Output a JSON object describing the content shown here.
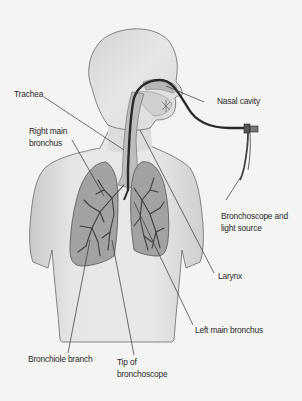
{
  "diagram": {
    "labels": {
      "trachea": "Trachea",
      "right_main_bronchus_1": "Right main",
      "right_main_bronchus_2": "bronchus",
      "nasal_cavity": "Nasal cavity",
      "bronchoscope_1": "Bronchoscope and",
      "bronchoscope_2": "light source",
      "larynx": "Larynx",
      "left_main_bronchus": "Left main bronchus",
      "bronchiole_branch": "Bronchiole branch",
      "tip_1": "Tip of",
      "tip_2": "bronchoscope"
    },
    "colors": {
      "background": "#f4f4f2",
      "body_fill": "#e2e2e0",
      "body_outline": "#6a6a6a",
      "lung_fill": "#9c9c9a",
      "airway_fill": "#c4c4c2",
      "scope": "#2a2a2a",
      "leader_line": "#333333",
      "text": "#2a2a2a"
    }
  }
}
